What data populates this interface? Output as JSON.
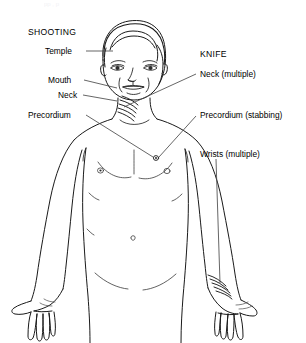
{
  "diagram": {
    "title_faint_cropped_text": "pp                  ,              p",
    "groups": [
      {
        "heading": "SHOOTING",
        "side": "left",
        "labels": [
          {
            "text": "Temple",
            "x": 45,
            "y": 48
          },
          {
            "text": "Mouth",
            "x": 48,
            "y": 77
          },
          {
            "text": "Neck",
            "x": 58,
            "y": 92
          },
          {
            "text": "Precordium",
            "x": 28,
            "y": 112
          }
        ]
      },
      {
        "heading": "KNIFE",
        "side": "right",
        "labels": [
          {
            "text": "Neck (multiple)",
            "x": 200,
            "y": 73
          },
          {
            "text": "Precordium (stabbing)",
            "x": 200,
            "y": 114
          },
          {
            "text": "Wrists (multiple)",
            "x": 200,
            "y": 152
          }
        ]
      }
    ],
    "group_headings": {
      "left": "SHOOTING",
      "right": "KNIFE"
    },
    "injury_markers": [
      {
        "name": "temple-gunshot",
        "type": "entry-point"
      },
      {
        "name": "mouth-gunshot",
        "type": "entry-point"
      },
      {
        "name": "neck-gunshot",
        "type": "entry-point"
      },
      {
        "name": "precordium-gunshot",
        "type": "entry-point"
      },
      {
        "name": "neck-knife-slashes",
        "type": "multiple-slashes",
        "count": 5
      },
      {
        "name": "precordium-stab",
        "type": "stab-wound"
      },
      {
        "name": "right-wrist-slashes",
        "type": "multiple-slashes",
        "count": 5
      }
    ],
    "colors": {
      "ink": "#000000",
      "leader": "#444444",
      "background": "#ffffff"
    }
  }
}
